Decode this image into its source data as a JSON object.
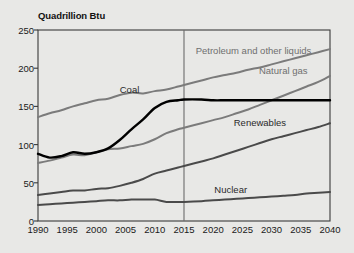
{
  "chart_data": {
    "type": "line",
    "title": "",
    "ylabel": "Quadrillion Btu",
    "xlabel": "",
    "xlim": [
      1990,
      2040
    ],
    "ylim": [
      0,
      250
    ],
    "yticks": [
      0,
      50,
      100,
      150,
      200,
      250
    ],
    "xticks": [
      1990,
      1995,
      2000,
      2005,
      2010,
      2015,
      2020,
      2025,
      2030,
      2035,
      2040
    ],
    "grid": false,
    "legend_position": "inline-labels",
    "history_projection_divider": 2015,
    "x": [
      1990,
      1992,
      1994,
      1996,
      1998,
      2000,
      2002,
      2004,
      2006,
      2008,
      2010,
      2012,
      2014,
      2015,
      2018,
      2020,
      2022,
      2024,
      2026,
      2028,
      2030,
      2032,
      2034,
      2036,
      2038,
      2040
    ],
    "series": [
      {
        "name": "Petroleum and other liquids",
        "color": "#7b7b7b",
        "width": 2.0,
        "label_x": 2017,
        "label_y": 222,
        "values": [
          136,
          141,
          145,
          150,
          154,
          158,
          160,
          165,
          168,
          167,
          170,
          172,
          176,
          178,
          184,
          188,
          191,
          194,
          198,
          201,
          205,
          209,
          213,
          217,
          221,
          225
        ]
      },
      {
        "name": "Natural gas",
        "color": "#7b7b7b",
        "width": 2.0,
        "label_x": 2032,
        "label_y": 196,
        "values": [
          76,
          79,
          83,
          87,
          86,
          90,
          94,
          95,
          98,
          101,
          107,
          115,
          120,
          122,
          128,
          132,
          136,
          141,
          146,
          152,
          158,
          164,
          170,
          176,
          182,
          190
        ]
      },
      {
        "name": "Coal",
        "color": "#000000",
        "width": 2.4,
        "label_x": 2004,
        "label_y": 172,
        "values": [
          88,
          83,
          85,
          90,
          88,
          90,
          95,
          106,
          120,
          133,
          148,
          156,
          158,
          159,
          159,
          158,
          158,
          158,
          158,
          158,
          158,
          158,
          158,
          158,
          158,
          158
        ]
      },
      {
        "name": "Renewables",
        "color": "#4a4a4a",
        "width": 2.0,
        "label_x": 2028,
        "label_y": 128,
        "values": [
          34,
          36,
          38,
          40,
          40,
          42,
          43,
          46,
          50,
          55,
          62,
          66,
          70,
          72,
          78,
          82,
          87,
          92,
          97,
          102,
          107,
          111,
          115,
          119,
          123,
          128
        ]
      },
      {
        "name": "Nuclear",
        "color": "#4a4a4a",
        "width": 2.0,
        "label_x": 2023,
        "label_y": 40,
        "values": [
          21,
          22,
          23,
          24,
          25,
          26,
          27,
          27,
          28,
          28,
          28,
          25,
          25,
          25,
          26,
          27,
          28,
          29,
          30,
          31,
          32,
          33,
          34,
          36,
          37,
          38
        ]
      }
    ]
  },
  "axis": {
    "y_title": "Quadrillion Btu",
    "y_ticks": [
      "250",
      "200",
      "150",
      "100",
      "50",
      "0"
    ],
    "x_ticks": [
      "1990",
      "1995",
      "2000",
      "2005",
      "2010",
      "2015",
      "2020",
      "2025",
      "2030",
      "2035",
      "2040"
    ]
  },
  "labels": {
    "petroleum": "Petroleum and other liquids",
    "natural_gas": "Natural gas",
    "coal": "Coal",
    "renewables": "Renewables",
    "nuclear": "Nuclear"
  },
  "colors": {
    "background": "#e8e8e6",
    "axis": "#3a3a3a",
    "petroleum": "#7b7b7b",
    "natural_gas": "#7b7b7b",
    "coal": "#000000",
    "renewables": "#4a4a4a",
    "nuclear": "#4a4a4a",
    "label_gray": "#6f6f6f",
    "label_dark": "#2a2a2a"
  }
}
